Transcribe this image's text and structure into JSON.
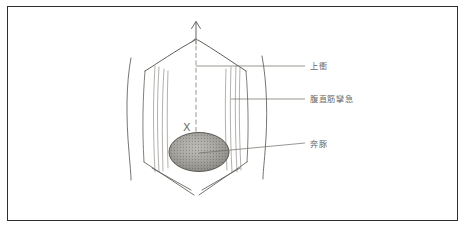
{
  "page": {
    "background_color": "#ffffff",
    "border_color": "#2e2e2e",
    "ink_color": "#5a5954"
  },
  "figure": {
    "name": "abdominal-diagnosis-drawing"
  },
  "marks": {
    "x_mark": "X",
    "arrow_direction": "up"
  },
  "labels": [
    {
      "id": "jousho",
      "text": "上衝",
      "reading": "josho",
      "meaning": "upward rush",
      "leader_from": {
        "x": 196,
        "y": 66
      },
      "leader_to": {
        "x": 305,
        "y": 66
      }
    },
    {
      "id": "fukuchokukin-rankyu",
      "text": "腹直筋攣急",
      "reading": "fukuchokukin rankyu",
      "meaning": "rectus abdominis spasm",
      "leader_from": {
        "x": 231,
        "y": 99
      },
      "leader_to": {
        "x": 305,
        "y": 99
      }
    },
    {
      "id": "honton",
      "text": "奔豚",
      "reading": "honton",
      "meaning": "running piglet",
      "leader_from": {
        "x": 202,
        "y": 152
      },
      "leader_to": {
        "x": 305,
        "y": 143
      }
    }
  ]
}
